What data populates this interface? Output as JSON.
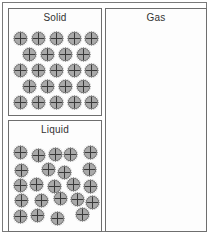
{
  "figure": {
    "background_color": "#ffffff",
    "border_color": "#7a7a7a",
    "width": 209,
    "height": 234
  },
  "panels": [
    {
      "id": "solid",
      "label": "Solid",
      "particle_style": "hatched-circle-with-cross",
      "particle_color": "#a9a9a9",
      "particle_count": 23,
      "arrangement": "ordered close-packed lattice, rows of 5-4-5-4-5",
      "particles": [
        {
          "x": 16,
          "y": 34
        },
        {
          "x": 34,
          "y": 34
        },
        {
          "x": 52,
          "y": 34
        },
        {
          "x": 70,
          "y": 34
        },
        {
          "x": 87,
          "y": 34
        },
        {
          "x": 25,
          "y": 50
        },
        {
          "x": 43,
          "y": 50
        },
        {
          "x": 61,
          "y": 50
        },
        {
          "x": 79,
          "y": 50
        },
        {
          "x": 16,
          "y": 66
        },
        {
          "x": 34,
          "y": 66
        },
        {
          "x": 52,
          "y": 66
        },
        {
          "x": 70,
          "y": 66
        },
        {
          "x": 87,
          "y": 66
        },
        {
          "x": 25,
          "y": 82
        },
        {
          "x": 43,
          "y": 82
        },
        {
          "x": 61,
          "y": 82
        },
        {
          "x": 79,
          "y": 82
        },
        {
          "x": 16,
          "y": 98
        },
        {
          "x": 34,
          "y": 98
        },
        {
          "x": 52,
          "y": 98
        },
        {
          "x": 70,
          "y": 98
        },
        {
          "x": 87,
          "y": 98
        }
      ]
    },
    {
      "id": "liquid",
      "label": "Liquid",
      "particle_style": "hatched-circle-with-cross",
      "particle_color": "#a9a9a9",
      "particle_count": 23,
      "arrangement": "disordered but closely packed, irregular clusters with gaps",
      "particles": [
        {
          "x": 16,
          "y": 148
        },
        {
          "x": 34,
          "y": 151
        },
        {
          "x": 51,
          "y": 150
        },
        {
          "x": 66,
          "y": 150
        },
        {
          "x": 86,
          "y": 148
        },
        {
          "x": 17,
          "y": 166
        },
        {
          "x": 44,
          "y": 165
        },
        {
          "x": 60,
          "y": 168
        },
        {
          "x": 85,
          "y": 165
        },
        {
          "x": 16,
          "y": 181
        },
        {
          "x": 32,
          "y": 180
        },
        {
          "x": 50,
          "y": 182
        },
        {
          "x": 69,
          "y": 180
        },
        {
          "x": 86,
          "y": 182
        },
        {
          "x": 17,
          "y": 196
        },
        {
          "x": 37,
          "y": 196
        },
        {
          "x": 56,
          "y": 194
        },
        {
          "x": 73,
          "y": 195
        },
        {
          "x": 88,
          "y": 198
        },
        {
          "x": 16,
          "y": 212
        },
        {
          "x": 33,
          "y": 211
        },
        {
          "x": 53,
          "y": 214
        },
        {
          "x": 78,
          "y": 210
        }
      ]
    },
    {
      "id": "gas",
      "label": "Gas",
      "particle_style": "smooth-shaded-sphere",
      "particle_color": "#c9c9c9",
      "particle_count": 12,
      "arrangement": "widely separated, randomly distributed",
      "particles": [
        {
          "x": 26,
          "y": 41
        },
        {
          "x": 62,
          "y": 48
        },
        {
          "x": 91,
          "y": 32
        },
        {
          "x": 14,
          "y": 95
        },
        {
          "x": 48,
          "y": 86
        },
        {
          "x": 83,
          "y": 89
        },
        {
          "x": 30,
          "y": 140
        },
        {
          "x": 61,
          "y": 161
        },
        {
          "x": 87,
          "y": 140
        },
        {
          "x": 11,
          "y": 158
        },
        {
          "x": 33,
          "y": 188
        },
        {
          "x": 91,
          "y": 188
        }
      ]
    }
  ]
}
